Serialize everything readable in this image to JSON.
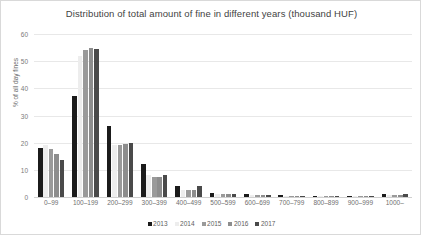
{
  "chart_data": {
    "type": "bar",
    "title": "Distribution of total amount of fine in different years (thousand HUF)",
    "xlabel": "",
    "ylabel": "% of all day fines",
    "ylim": [
      0,
      60
    ],
    "yticks": [
      0,
      10,
      20,
      30,
      40,
      50,
      60
    ],
    "grid": true,
    "legend_position": "bottom",
    "categories": [
      "0–99",
      "100–199",
      "200–299",
      "300–399",
      "400–499",
      "500–599",
      "600–699",
      "700–799",
      "800–899",
      "900–999",
      "1000–"
    ],
    "series": [
      {
        "name": "2013",
        "color": "#1b1b1b",
        "values": [
          18.0,
          37.0,
          26.0,
          12.0,
          4.0,
          1.5,
          1.0,
          0.7,
          0.4,
          0.3,
          1.0
        ]
      },
      {
        "name": "2014",
        "color": "#ededed",
        "values": [
          19.0,
          52.0,
          19.0,
          8.0,
          2.5,
          1.0,
          0.6,
          0.4,
          0.3,
          0.2,
          0.8
        ]
      },
      {
        "name": "2015",
        "color": "#9a9a9a",
        "values": [
          17.5,
          54.0,
          19.0,
          7.5,
          2.5,
          1.0,
          0.6,
          0.4,
          0.3,
          0.2,
          0.8
        ]
      },
      {
        "name": "2016",
        "color": "#8d8d8d",
        "values": [
          16.0,
          55.0,
          19.5,
          7.5,
          2.5,
          1.0,
          0.6,
          0.4,
          0.3,
          0.2,
          0.8
        ]
      },
      {
        "name": "2017",
        "color": "#4a4a4a",
        "values": [
          13.5,
          54.5,
          20.0,
          8.0,
          4.0,
          1.2,
          0.6,
          0.4,
          0.3,
          0.2,
          1.0
        ]
      }
    ]
  }
}
